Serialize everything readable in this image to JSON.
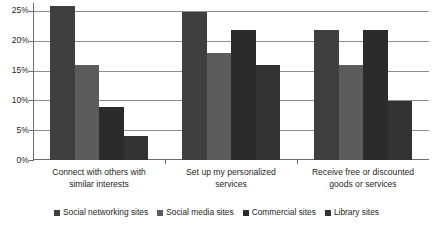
{
  "chart_data": {
    "type": "bar",
    "title": "",
    "subtitle": "",
    "xlabel": "",
    "ylabel": "",
    "ylim": [
      0,
      26.5
    ],
    "ytick_values": [
      0,
      5,
      10,
      15,
      20,
      25
    ],
    "ytick_labels": [
      "0%",
      "5%",
      "10%",
      "15%",
      "20%",
      "25%"
    ],
    "grid": true,
    "legend_position": "bottom",
    "categories": [
      "Connect with others with similar interests",
      "Set up my personalized services",
      "Receive free or discounted goods or services"
    ],
    "category_lines": [
      [
        "Connect with others with",
        "similar interests"
      ],
      [
        "Set up my personalized",
        "services"
      ],
      [
        "Receive free or discounted",
        "goods or services"
      ]
    ],
    "series": [
      {
        "name": "Social networking sites",
        "color": "#3f3f3f",
        "values": [
          26,
          25,
          22
        ]
      },
      {
        "name": "Social media sites",
        "color": "#5c5c5c",
        "values": [
          16,
          18,
          16
        ]
      },
      {
        "name": "Commercial sites",
        "color": "#2b2b2b",
        "values": [
          9,
          22,
          22
        ]
      },
      {
        "name": "Library sites",
        "color": "#333333",
        "values": [
          4,
          16,
          10
        ]
      }
    ]
  },
  "legend": {
    "items": [
      {
        "label": "Social networking sites"
      },
      {
        "label": "Social media sites"
      },
      {
        "label": "Commercial sites"
      },
      {
        "label": "Library sites"
      }
    ]
  },
  "axis": {
    "y_labels": [
      "25%",
      "20%",
      "15%",
      "10%",
      "5%",
      "0%"
    ]
  }
}
